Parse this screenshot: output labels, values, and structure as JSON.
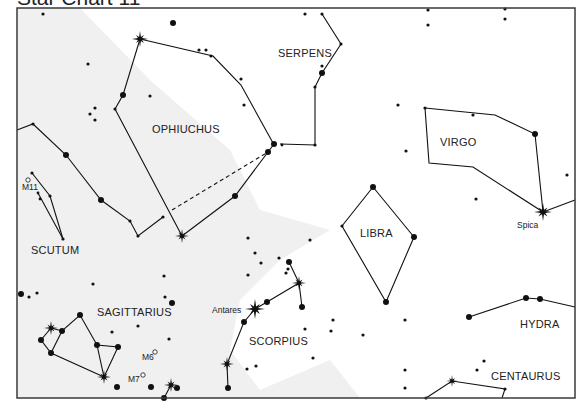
{
  "title": "Star Chart 11",
  "colors": {
    "frame": "#3a3a3a",
    "ink": "#111111",
    "milky_way": "#f0f0f0",
    "background": "#ffffff"
  },
  "frame": {
    "x": 17,
    "y": 8,
    "width": 558,
    "height": 390
  },
  "constellations": [
    {
      "name": "SERPENS",
      "x": 278,
      "y": 57
    },
    {
      "name": "OPHIUCHUS",
      "x": 152,
      "y": 133
    },
    {
      "name": "VIRGO",
      "x": 440,
      "y": 146
    },
    {
      "name": "SCUTUM",
      "x": 31,
      "y": 254
    },
    {
      "name": "LIBRA",
      "x": 360,
      "y": 237
    },
    {
      "name": "SAGITTARIUS",
      "x": 97,
      "y": 316
    },
    {
      "name": "SCORPIUS",
      "x": 249,
      "y": 345
    },
    {
      "name": "HYDRA",
      "x": 520,
      "y": 328
    },
    {
      "name": "CENTAURUS",
      "x": 491,
      "y": 380
    }
  ],
  "star_labels": [
    {
      "name": "Antares",
      "x": 212,
      "y": 313
    },
    {
      "name": "Spica",
      "x": 517,
      "y": 228
    },
    {
      "name": "M11",
      "x": 22,
      "y": 190
    },
    {
      "name": "M6",
      "x": 142,
      "y": 360
    },
    {
      "name": "M7",
      "x": 128,
      "y": 382
    }
  ],
  "clusters": [
    {
      "name": "M11",
      "x": 28,
      "y": 180
    },
    {
      "name": "M6",
      "x": 155,
      "y": 352
    },
    {
      "name": "M7",
      "x": 143,
      "y": 375
    }
  ],
  "bright_stars": [
    {
      "x": 140,
      "y": 39,
      "r": 8
    },
    {
      "x": 182,
      "y": 236,
      "r": 7
    },
    {
      "x": 255,
      "y": 309,
      "r": 10,
      "name": "Antares"
    },
    {
      "x": 299,
      "y": 283,
      "r": 7
    },
    {
      "x": 543,
      "y": 212,
      "r": 9,
      "name": "Spica"
    },
    {
      "x": 51,
      "y": 328,
      "r": 7
    },
    {
      "x": 104,
      "y": 377,
      "r": 7
    },
    {
      "x": 227,
      "y": 364,
      "r": 7
    },
    {
      "x": 171,
      "y": 385,
      "r": 7
    },
    {
      "x": 452,
      "y": 381,
      "r": 6
    }
  ],
  "stars": [
    {
      "x": 43,
      "y": 14,
      "r": 1.6
    },
    {
      "x": 173,
      "y": 23,
      "r": 3
    },
    {
      "x": 305,
      "y": 14,
      "r": 1.6
    },
    {
      "x": 322,
      "y": 14,
      "r": 1.6
    },
    {
      "x": 428,
      "y": 10,
      "r": 1.6
    },
    {
      "x": 428,
      "y": 25,
      "r": 1.6
    },
    {
      "x": 505,
      "y": 9,
      "r": 1.6
    },
    {
      "x": 505,
      "y": 19,
      "r": 1.6
    },
    {
      "x": 88,
      "y": 64,
      "r": 1.6
    },
    {
      "x": 206,
      "y": 50,
      "r": 1.6
    },
    {
      "x": 199,
      "y": 50,
      "r": 1.6
    },
    {
      "x": 241,
      "y": 79,
      "r": 1.6
    },
    {
      "x": 341,
      "y": 44,
      "r": 1.6
    },
    {
      "x": 322,
      "y": 66,
      "r": 1.6
    },
    {
      "x": 322,
      "y": 73,
      "r": 3
    },
    {
      "x": 315,
      "y": 87,
      "r": 1.6
    },
    {
      "x": 123,
      "y": 95,
      "r": 3
    },
    {
      "x": 115,
      "y": 109,
      "r": 1.6
    },
    {
      "x": 150,
      "y": 96,
      "r": 1.6
    },
    {
      "x": 95,
      "y": 108,
      "r": 1.6
    },
    {
      "x": 90,
      "y": 114,
      "r": 1.6
    },
    {
      "x": 95,
      "y": 120,
      "r": 1.6
    },
    {
      "x": 211,
      "y": 56,
      "r": 1.6
    },
    {
      "x": 244,
      "y": 105,
      "r": 1.6
    },
    {
      "x": 274,
      "y": 144,
      "r": 3
    },
    {
      "x": 268,
      "y": 152,
      "r": 3
    },
    {
      "x": 282,
      "y": 145,
      "r": 1.4
    },
    {
      "x": 315,
      "y": 145,
      "r": 1.6
    },
    {
      "x": 235,
      "y": 196,
      "r": 3
    },
    {
      "x": 163,
      "y": 217,
      "r": 1.6
    },
    {
      "x": 398,
      "y": 105,
      "r": 1.6
    },
    {
      "x": 425,
      "y": 108,
      "r": 1.6
    },
    {
      "x": 473,
      "y": 115,
      "r": 1.6
    },
    {
      "x": 535,
      "y": 134,
      "r": 3
    },
    {
      "x": 406,
      "y": 151,
      "r": 1.6
    },
    {
      "x": 567,
      "y": 175,
      "r": 1.6
    },
    {
      "x": 476,
      "y": 199,
      "r": 1.6
    },
    {
      "x": 33,
      "y": 124,
      "r": 1.6
    },
    {
      "x": 66,
      "y": 155,
      "r": 3
    },
    {
      "x": 101,
      "y": 200,
      "r": 3
    },
    {
      "x": 130,
      "y": 221,
      "r": 1.6
    },
    {
      "x": 138,
      "y": 236,
      "r": 1.6
    },
    {
      "x": 32,
      "y": 173,
      "r": 1.6
    },
    {
      "x": 38,
      "y": 193,
      "r": 1.4
    },
    {
      "x": 40,
      "y": 199,
      "r": 1.4
    },
    {
      "x": 50,
      "y": 196,
      "r": 1.6
    },
    {
      "x": 63,
      "y": 239,
      "r": 1.6
    },
    {
      "x": 248,
      "y": 238,
      "r": 1.6
    },
    {
      "x": 310,
      "y": 240,
      "r": 1.6
    },
    {
      "x": 373,
      "y": 187,
      "r": 3
    },
    {
      "x": 342,
      "y": 226,
      "r": 1.6
    },
    {
      "x": 414,
      "y": 237,
      "r": 3
    },
    {
      "x": 386,
      "y": 302,
      "r": 3
    },
    {
      "x": 255,
      "y": 253,
      "r": 1.6
    },
    {
      "x": 261,
      "y": 263,
      "r": 1.6
    },
    {
      "x": 279,
      "y": 258,
      "r": 1.6
    },
    {
      "x": 289,
      "y": 262,
      "r": 3
    },
    {
      "x": 288,
      "y": 269,
      "r": 1.6
    },
    {
      "x": 286,
      "y": 273,
      "r": 1.6
    },
    {
      "x": 248,
      "y": 275,
      "r": 1.6
    },
    {
      "x": 267,
      "y": 302,
      "r": 3
    },
    {
      "x": 302,
      "y": 307,
      "r": 3
    },
    {
      "x": 244,
      "y": 322,
      "r": 3
    },
    {
      "x": 305,
      "y": 329,
      "r": 1.6
    },
    {
      "x": 333,
      "y": 320,
      "r": 1.6
    },
    {
      "x": 331,
      "y": 331,
      "r": 1.6
    },
    {
      "x": 363,
      "y": 335,
      "r": 1.6
    },
    {
      "x": 313,
      "y": 358,
      "r": 1.6
    },
    {
      "x": 247,
      "y": 369,
      "r": 1.6
    },
    {
      "x": 256,
      "y": 366,
      "r": 1.6
    },
    {
      "x": 228,
      "y": 388,
      "r": 3
    },
    {
      "x": 526,
      "y": 298,
      "r": 3
    },
    {
      "x": 540,
      "y": 299,
      "r": 3
    },
    {
      "x": 469,
      "y": 317,
      "r": 3
    },
    {
      "x": 405,
      "y": 320,
      "r": 1.6
    },
    {
      "x": 405,
      "y": 370,
      "r": 1.6
    },
    {
      "x": 405,
      "y": 388,
      "r": 1.6
    },
    {
      "x": 484,
      "y": 361,
      "r": 1.6
    },
    {
      "x": 477,
      "y": 370,
      "r": 1.6
    },
    {
      "x": 505,
      "y": 389,
      "r": 1.6
    },
    {
      "x": 426,
      "y": 398,
      "r": 1.6
    },
    {
      "x": 21,
      "y": 294,
      "r": 3
    },
    {
      "x": 29,
      "y": 297,
      "r": 1.6
    },
    {
      "x": 37,
      "y": 293,
      "r": 1.6
    },
    {
      "x": 93,
      "y": 284,
      "r": 1.6
    },
    {
      "x": 80,
      "y": 315,
      "r": 3
    },
    {
      "x": 62,
      "y": 331,
      "r": 3
    },
    {
      "x": 41,
      "y": 340,
      "r": 3
    },
    {
      "x": 51,
      "y": 353,
      "r": 3
    },
    {
      "x": 97,
      "y": 345,
      "r": 3
    },
    {
      "x": 118,
      "y": 347,
      "r": 3
    },
    {
      "x": 112,
      "y": 332,
      "r": 1.6
    },
    {
      "x": 138,
      "y": 326,
      "r": 1.6
    },
    {
      "x": 164,
      "y": 276,
      "r": 1.6
    },
    {
      "x": 165,
      "y": 297,
      "r": 1.6
    },
    {
      "x": 172,
      "y": 303,
      "r": 3
    },
    {
      "x": 169,
      "y": 339,
      "r": 1.6
    },
    {
      "x": 117,
      "y": 387,
      "r": 3
    },
    {
      "x": 151,
      "y": 387,
      "r": 3
    },
    {
      "x": 177,
      "y": 388,
      "r": 3
    },
    {
      "x": 164,
      "y": 398,
      "r": 3
    }
  ],
  "lines": [
    {
      "points": [
        [
          140,
          39
        ],
        [
          213,
          56
        ],
        [
          241,
          85
        ],
        [
          273,
          143
        ]
      ]
    },
    {
      "points": [
        [
          140,
          39
        ],
        [
          123,
          95
        ],
        [
          115,
          109
        ],
        [
          182,
          236
        ]
      ]
    },
    {
      "points": [
        [
          182,
          236
        ],
        [
          235,
          196
        ],
        [
          268,
          152
        ],
        [
          274,
          144
        ]
      ]
    },
    {
      "points": [
        [
          280,
          144
        ],
        [
          315,
          145
        ],
        [
          315,
          87
        ]
      ]
    },
    {
      "points": [
        [
          315,
          87
        ],
        [
          322,
          73
        ],
        [
          341,
          44
        ],
        [
          322,
          14
        ]
      ]
    },
    {
      "points": [
        [
          17,
          130
        ],
        [
          33,
          124
        ],
        [
          66,
          155
        ],
        [
          101,
          200
        ],
        [
          130,
          221
        ],
        [
          138,
          236
        ],
        [
          163,
          217
        ]
      ]
    },
    {
      "points": [
        [
          32,
          173
        ],
        [
          50,
          196
        ],
        [
          63,
          239
        ]
      ]
    },
    {
      "points": [
        [
          38,
          193
        ],
        [
          63,
          239
        ]
      ]
    },
    {
      "points": [
        [
          373,
          187
        ],
        [
          342,
          226
        ],
        [
          386,
          302
        ],
        [
          414,
          237
        ],
        [
          373,
          187
        ]
      ]
    },
    {
      "points": [
        [
          425,
          108
        ],
        [
          495,
          115
        ],
        [
          535,
          134
        ],
        [
          543,
          212
        ]
      ]
    },
    {
      "points": [
        [
          425,
          108
        ],
        [
          429,
          163
        ],
        [
          473,
          167
        ],
        [
          543,
          212
        ]
      ]
    },
    {
      "points": [
        [
          543,
          212
        ],
        [
          575,
          200
        ]
      ]
    },
    {
      "points": [
        [
          255,
          309
        ],
        [
          267,
          302
        ],
        [
          299,
          283
        ],
        [
          302,
          307
        ]
      ]
    },
    {
      "points": [
        [
          299,
          283
        ],
        [
          289,
          262
        ]
      ]
    },
    {
      "points": [
        [
          255,
          309
        ],
        [
          244,
          322
        ],
        [
          227,
          364
        ],
        [
          228,
          388
        ]
      ]
    },
    {
      "points": [
        [
          469,
          317
        ],
        [
          526,
          298
        ],
        [
          540,
          299
        ],
        [
          575,
          307
        ]
      ]
    },
    {
      "points": [
        [
          426,
          398
        ],
        [
          452,
          381
        ],
        [
          505,
          389
        ],
        [
          502,
          398
        ]
      ]
    },
    {
      "points": [
        [
          51,
          328
        ],
        [
          62,
          331
        ],
        [
          80,
          315
        ],
        [
          97,
          345
        ],
        [
          118,
          347
        ],
        [
          104,
          377
        ],
        [
          97,
          345
        ]
      ]
    },
    {
      "points": [
        [
          51,
          328
        ],
        [
          41,
          340
        ],
        [
          51,
          353
        ],
        [
          104,
          377
        ]
      ]
    },
    {
      "points": [
        [
          62,
          331
        ],
        [
          51,
          353
        ]
      ]
    },
    {
      "points": [
        [
          171,
          385
        ],
        [
          164,
          398
        ]
      ]
    }
  ],
  "dashed_lines": [
    {
      "points": [
        [
          172,
          210
        ],
        [
          268,
          152
        ]
      ]
    }
  ],
  "milky_way_path": "M17,8 L80,8 L150,80 L230,150 L260,210 L330,230 L280,260 L240,300 L230,350 L260,390 L330,360 L360,398 L17,398 Z"
}
